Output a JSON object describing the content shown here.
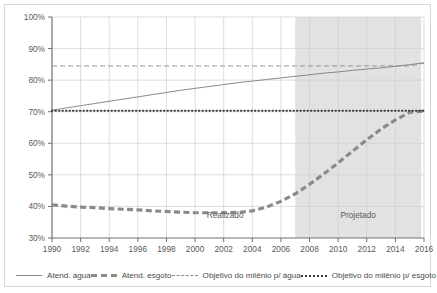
{
  "chart_data": {
    "type": "line",
    "title": "",
    "subtitle": "",
    "xlabel": "",
    "ylabel": "",
    "xlim": [
      1990,
      2016
    ],
    "ylim": [
      30,
      100
    ],
    "y_tick_format": "percent",
    "grid": true,
    "legend_position": "bottom",
    "x": [
      1990,
      1991,
      1992,
      1993,
      1994,
      1995,
      1996,
      1997,
      1998,
      1999,
      2000,
      2001,
      2002,
      2003,
      2004,
      2005,
      2006,
      2007,
      2008,
      2009,
      2010,
      2011,
      2012,
      2013,
      2014,
      2015,
      2016
    ],
    "xticks": [
      1990,
      1992,
      1994,
      1996,
      1998,
      2000,
      2002,
      2004,
      2006,
      2008,
      2010,
      2012,
      2014,
      2016
    ],
    "xtick_labels": [
      "1990",
      "1992",
      "1994",
      "1996",
      "1998",
      "2000",
      "2002",
      "2004",
      "2006",
      "2008",
      "2010",
      "2012",
      "2014",
      "2016"
    ],
    "yticks": [
      30,
      40,
      50,
      60,
      70,
      80,
      90,
      100
    ],
    "ytick_labels": [
      "30%",
      "40%",
      "50%",
      "60%",
      "70%",
      "80%",
      "90%",
      "100%"
    ],
    "series": [
      {
        "name": "Atend. água",
        "style": "solid-thin",
        "color": "#7d7d7d",
        "values": [
          70.5,
          71.2,
          71.9,
          72.6,
          73.3,
          74.0,
          74.7,
          75.4,
          76.1,
          76.8,
          77.4,
          78.0,
          78.6,
          79.2,
          79.7,
          80.2,
          80.7,
          81.2,
          81.7,
          82.2,
          82.6,
          83.1,
          83.5,
          83.9,
          84.4,
          84.9,
          85.5
        ]
      },
      {
        "name": "Atend. esgoto",
        "style": "dashed-thick",
        "color": "#8a8a8a",
        "values": [
          40.5,
          40.1,
          39.8,
          39.6,
          39.3,
          39.1,
          38.9,
          38.6,
          38.4,
          38.2,
          38.0,
          38.0,
          38.0,
          38.1,
          38.6,
          39.8,
          41.6,
          44.0,
          47.0,
          50.3,
          53.8,
          57.5,
          61.1,
          64.5,
          67.4,
          69.8,
          70.2
        ]
      },
      {
        "name": "Objetivo do milênio p/ água",
        "style": "dashed-thin",
        "color": "#8a8a8a",
        "values": [
          84.5,
          84.5,
          84.5,
          84.5,
          84.5,
          84.5,
          84.5,
          84.5,
          84.5,
          84.5,
          84.5,
          84.5,
          84.5,
          84.5,
          84.5,
          84.5,
          84.5,
          84.5,
          84.5,
          84.5,
          84.5,
          84.5,
          84.5,
          84.5,
          84.5,
          84.5,
          85.4
        ]
      },
      {
        "name": "Objetivo do milênio p/ esgoto",
        "style": "dotted",
        "color": "#3a3a3a",
        "values": [
          70.3,
          70.3,
          70.3,
          70.3,
          70.3,
          70.3,
          70.3,
          70.3,
          70.3,
          70.3,
          70.3,
          70.3,
          70.3,
          70.3,
          70.3,
          70.3,
          70.3,
          70.3,
          70.3,
          70.3,
          70.3,
          70.3,
          70.3,
          70.3,
          70.3,
          70.3,
          70.3
        ]
      }
    ],
    "annotations": [
      {
        "text": "Realizado",
        "x": 2002.1,
        "y": 36.3
      },
      {
        "text": "Projetado",
        "x": 2011.4,
        "y": 36.3
      }
    ],
    "shaded_regions": [
      {
        "label": "Projetado",
        "x_start": 2007,
        "x_end": 2015.8,
        "color": "#e2e2e2"
      }
    ]
  },
  "legend": {
    "items": [
      {
        "label": "Atend. água",
        "swatch": "solid-line-swatch"
      },
      {
        "label": "Atend. esgoto",
        "swatch": "thick-dashed-line-swatch"
      },
      {
        "label": "Objetivo do milênio p/ água",
        "swatch": "thin-dashed-line-swatch"
      },
      {
        "label": "Objetivo do milênio p/ esgoto",
        "swatch": "dotted-line-swatch"
      }
    ]
  }
}
